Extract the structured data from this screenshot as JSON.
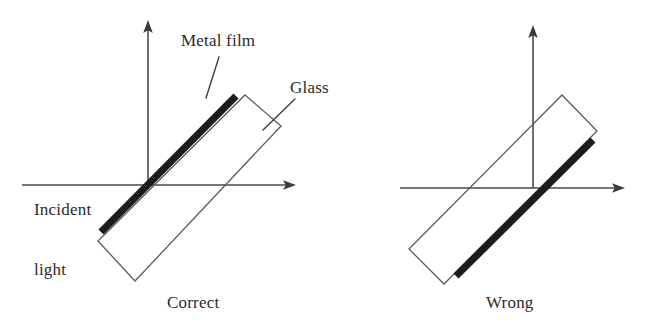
{
  "figure": {
    "width": 651,
    "height": 332,
    "background_color": "#ffffff",
    "line_color": "#4a4a4a",
    "film_color": "#1c1c1c",
    "glass_color": "#5a5a5a"
  },
  "labels": {
    "metal_film": "Metal film",
    "glass": "Glass",
    "incident_light_line1": "Incident",
    "incident_light_line2": "light",
    "correct": "Correct",
    "wrong": "Wrong"
  },
  "panels": [
    {
      "id": "correct",
      "caption": "Correct",
      "origin": {
        "x": 148,
        "y": 185
      },
      "film_side": "incident-facing (upper-left face)",
      "film_passes_through_origin": true,
      "axes": {
        "vertical": {
          "x1": 148,
          "y1": 185,
          "x2": 148,
          "y2": 22
        },
        "horizontal": {
          "x1": 22,
          "y1": 185,
          "x2": 296,
          "y2": 185
        }
      },
      "glass_corners": [
        {
          "x": 245,
          "y": 95
        },
        {
          "x": 281,
          "y": 126
        },
        {
          "x": 135,
          "y": 281
        },
        {
          "x": 98,
          "y": 241
        }
      ],
      "metal_film": {
        "x1": 236,
        "y1": 95,
        "x2": 100,
        "y2": 233
      }
    },
    {
      "id": "wrong",
      "caption": "Wrong",
      "origin": {
        "x": 533,
        "y": 188
      },
      "film_side": "far side (lower-right face)",
      "film_passes_through_origin": true,
      "axes": {
        "vertical": {
          "x1": 533,
          "y1": 188,
          "x2": 533,
          "y2": 27
        },
        "horizontal": {
          "x1": 400,
          "y1": 188,
          "x2": 625,
          "y2": 188
        }
      },
      "glass_corners": [
        {
          "x": 562,
          "y": 95
        },
        {
          "x": 597,
          "y": 131
        },
        {
          "x": 444,
          "y": 284
        },
        {
          "x": 409,
          "y": 249
        }
      ],
      "metal_film": {
        "x1": 594,
        "y1": 139,
        "x2": 455,
        "y2": 277
      }
    }
  ],
  "leaders": [
    {
      "id": "metal-film-leader",
      "x1": 219,
      "y1": 57,
      "x2": 206,
      "y2": 98
    },
    {
      "id": "glass-leader",
      "x1": 295,
      "y1": 99,
      "x2": 263,
      "y2": 130
    }
  ]
}
